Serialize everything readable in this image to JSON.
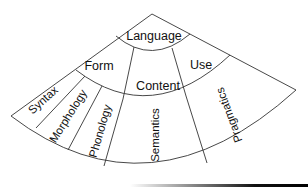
{
  "diagram": {
    "title": "Language",
    "components": {
      "form": "Form",
      "content": "Content",
      "use": "Use"
    },
    "subcomponents": {
      "syntax": "Syntax",
      "morphology": "Morphology",
      "phonology": "Phonology",
      "semantics": "Semantics",
      "pragmatics": "Pragmatics"
    },
    "colors": {
      "line": "#333333",
      "text": "#111111",
      "background": "#ffffff"
    }
  }
}
